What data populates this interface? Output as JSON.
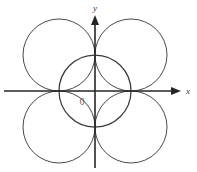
{
  "figure": {
    "background_color": "#ffffff",
    "axis_color": "#262626",
    "circle_color": "#4a4a4a",
    "label_color": "#333333"
  },
  "labels": {
    "x_axis": "x",
    "y_axis": "y",
    "origin": "0"
  },
  "chart_data": {
    "type": "scatter",
    "title": "",
    "xlabel": "x",
    "ylabel": "y",
    "grid": false,
    "legend": null,
    "origin_label": "0",
    "origin_px": {
      "x": 95,
      "y": 91
    },
    "unit_px": 36,
    "xlim": [
      -2.64,
      2.83
    ],
    "ylim": [
      -2.25,
      2.53
    ],
    "axes": [
      {
        "name": "x-axis",
        "orientation": "horizontal",
        "start_px": {
          "x": 4,
          "y": 91
        },
        "end_px": {
          "x": 180,
          "y": 91
        },
        "arrow": "end",
        "label": "x",
        "label_px": {
          "x": 186,
          "y": 91
        }
      },
      {
        "name": "y-axis",
        "orientation": "vertical",
        "start_px": {
          "x": 95,
          "y": 168
        },
        "end_px": {
          "x": 95,
          "y": 16
        },
        "arrow": "end",
        "label": "y",
        "label_px": {
          "x": 95,
          "y": 8
        }
      }
    ],
    "circles": [
      {
        "name": "top-left-circle",
        "center": [
          -1,
          1
        ],
        "center_px": {
          "x": 59,
          "y": 55
        },
        "radius": 1,
        "radius_px": 36,
        "quadrant": "II"
      },
      {
        "name": "top-right-circle",
        "center": [
          1,
          1
        ],
        "center_px": {
          "x": 131,
          "y": 55
        },
        "radius": 1,
        "radius_px": 36,
        "quadrant": "I"
      },
      {
        "name": "bottom-left-circle",
        "center": [
          -1,
          -1
        ],
        "center_px": {
          "x": 59,
          "y": 127
        },
        "radius": 1,
        "radius_px": 36,
        "quadrant": "III"
      },
      {
        "name": "bottom-right-circle",
        "center": [
          1,
          -1
        ],
        "center_px": {
          "x": 131,
          "y": 127
        },
        "radius": 1,
        "radius_px": 36,
        "quadrant": "IV"
      },
      {
        "name": "center-circle",
        "center": [
          0,
          0
        ],
        "center_px": {
          "x": 95,
          "y": 91
        },
        "radius": 1,
        "radius_px": 36,
        "quadrant": "origin"
      }
    ]
  }
}
